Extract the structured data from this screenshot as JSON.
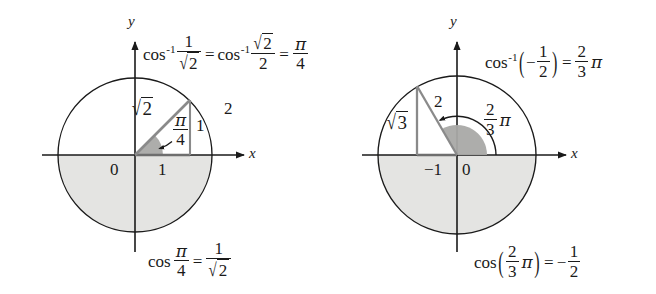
{
  "figure": {
    "type": "math-diagram",
    "background_color": "#ffffff",
    "ink_color": "#1a1a1a",
    "shade_color": "#e3e3e1",
    "sector_color": "#a9a9a7"
  },
  "left_panel": {
    "name": "arccos-one-over-root-two",
    "top_equation": {
      "arccos_label": "cos",
      "arccos_exponent": "-1",
      "arg_numerator": "1",
      "arg_denominator_radical": "2",
      "equals": "=",
      "second_arccos_label": "cos",
      "second_arccos_exponent": "-1",
      "second_numerator_radical": "2",
      "second_denominator": "2",
      "equals2": "=",
      "result_numerator": "π",
      "result_denominator": "4"
    },
    "bottom_equation": {
      "cos_label": "cos",
      "angle_numerator": "π",
      "angle_denominator": "4",
      "equals": "=",
      "value_numerator": "1",
      "value_denominator_radical": "2"
    },
    "axes": {
      "x_label": "x",
      "y_label": "y",
      "origin_label": "0"
    },
    "triangle": {
      "hypotenuse_label_radical": "2",
      "base_label": "1",
      "vertical_label": "1",
      "angle_numerator": "π",
      "angle_denominator": "4"
    },
    "extra_label": "2",
    "circle": {
      "center_x": 135,
      "center_y": 155,
      "radius": 77
    }
  },
  "right_panel": {
    "name": "arccos-negative-one-half",
    "top_equation": {
      "arccos_label": "cos",
      "arccos_exponent": "-1",
      "open_paren": "(",
      "minus": "−",
      "arg_numerator": "1",
      "arg_denominator": "2",
      "close_paren": ")",
      "equals": "=",
      "result_numerator": "2",
      "result_denominator": "3",
      "result_pi": "π"
    },
    "bottom_equation": {
      "cos_label": "cos",
      "open_paren": "(",
      "angle_numerator": "2",
      "angle_denominator": "3",
      "angle_pi": "π",
      "close_paren": ")",
      "equals": "=",
      "minus": "−",
      "value_numerator": "1",
      "value_denominator": "2"
    },
    "axes": {
      "x_label": "x",
      "y_label": "y",
      "origin_label": "0",
      "minus_one_label": "−1"
    },
    "triangle": {
      "hypotenuse_label": "2",
      "vertical_label_radical": "3",
      "base_label": "−1"
    },
    "angle_arc": {
      "numerator": "2",
      "denominator": "3",
      "pi": "π"
    },
    "circle": {
      "center_x": 457,
      "center_y": 155,
      "radius": 79
    }
  }
}
